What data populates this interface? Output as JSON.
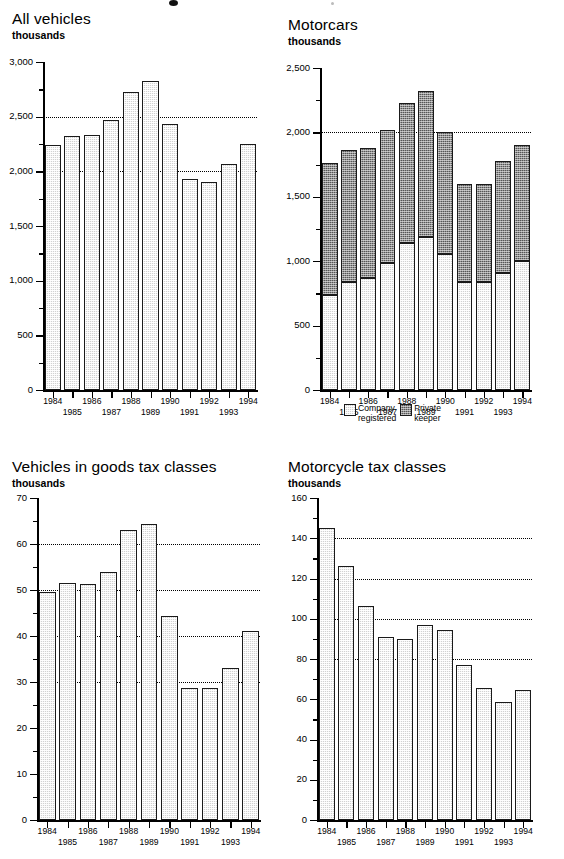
{
  "charts": [
    {
      "id": "all-vehicles",
      "title": "All vehicles",
      "units": "thousands",
      "chart_data": {
        "type": "bar",
        "title": "All vehicles",
        "xlabel": "",
        "ylabel": "thousands",
        "ylim": [
          0,
          3000
        ],
        "ytick_labels": [
          "0",
          "500",
          "1,000",
          "1,500",
          "2,000",
          "2,500",
          "3,000"
        ],
        "ytick_values": [
          0,
          500,
          1000,
          1500,
          2000,
          2500,
          3000
        ],
        "minor_tick_step": 250,
        "gridlines": [
          2000,
          2500
        ],
        "grid": "dotted-horizontal",
        "legend": "none",
        "categories": [
          "1984",
          "1985",
          "1986",
          "1987",
          "1988",
          "1989",
          "1990",
          "1991",
          "1992",
          "1993",
          "1994"
        ],
        "values": [
          2245,
          2320,
          2330,
          2470,
          2730,
          2830,
          2435,
          1930,
          1905,
          2070,
          2250
        ]
      }
    },
    {
      "id": "motorcars",
      "title": "Motorcars",
      "units": "thousands",
      "chart_data": {
        "type": "bar",
        "stacked": true,
        "title": "Motorcars",
        "xlabel": "",
        "ylabel": "thousands",
        "ylim": [
          0,
          2500
        ],
        "ytick_labels": [
          "0",
          "500",
          "1,000",
          "1,500",
          "2,000",
          "2,500"
        ],
        "ytick_values": [
          0,
          500,
          1000,
          1500,
          2000,
          2500
        ],
        "minor_tick_step": 250,
        "gridlines": [
          2000
        ],
        "grid": "dotted-horizontal",
        "legend": "bottom",
        "categories": [
          "1984",
          "1985",
          "1986",
          "1987",
          "1988",
          "1989",
          "1990",
          "1991",
          "1992",
          "1993",
          "1994"
        ],
        "series": [
          {
            "name": "Company registered",
            "values": [
              740,
              840,
              870,
              985,
              1140,
              1185,
              1055,
              840,
              840,
              905,
              1000
            ]
          },
          {
            "name": "Private keeper",
            "values": [
              1020,
              1020,
              1010,
              1030,
              1085,
              1135,
              950,
              760,
              760,
              870,
              905
            ]
          }
        ],
        "totals": [
          1760,
          1860,
          1880,
          2015,
          2225,
          2320,
          2005,
          1600,
          1600,
          1775,
          1905
        ],
        "legend_entries": [
          {
            "label": "Company\nregistered",
            "swatch": "light"
          },
          {
            "label": "Private\nkeeper",
            "swatch": "dark"
          }
        ]
      }
    },
    {
      "id": "goods-tax-classes",
      "title": "Vehicles in goods tax classes",
      "units": "thousands",
      "chart_data": {
        "type": "bar",
        "title": "Vehicles in goods tax classes",
        "xlabel": "",
        "ylabel": "thousands",
        "ylim": [
          0,
          70
        ],
        "ytick_labels": [
          "0",
          "10",
          "20",
          "30",
          "40",
          "50",
          "60",
          "70"
        ],
        "ytick_values": [
          0,
          10,
          20,
          30,
          40,
          50,
          60,
          70
        ],
        "minor_tick_step": 5,
        "gridlines": [
          30,
          40,
          50,
          60
        ],
        "grid": "dotted-horizontal",
        "legend": "none",
        "categories": [
          "1984",
          "1985",
          "1986",
          "1987",
          "1988",
          "1989",
          "1990",
          "1991",
          "1992",
          "1993",
          "1994"
        ],
        "values": [
          49.5,
          51.5,
          51.2,
          54.0,
          63.0,
          64.3,
          44.3,
          28.7,
          28.7,
          33.0,
          41.0
        ]
      }
    },
    {
      "id": "motorcycle-tax-classes",
      "title": "Motorcycle tax classes",
      "units": "thousands",
      "chart_data": {
        "type": "bar",
        "title": "Motorcycle tax classes",
        "xlabel": "",
        "ylabel": "thousands",
        "ylim": [
          0,
          160
        ],
        "ytick_labels": [
          "0",
          "20",
          "40",
          "60",
          "80",
          "100",
          "120",
          "140",
          "160"
        ],
        "ytick_values": [
          0,
          20,
          40,
          60,
          80,
          100,
          120,
          140,
          160
        ],
        "minor_tick_step": 10,
        "gridlines": [
          80,
          100,
          120,
          140
        ],
        "grid": "dotted-horizontal",
        "legend": "none",
        "categories": [
          "1984",
          "1985",
          "1986",
          "1987",
          "1988",
          "1989",
          "1990",
          "1991",
          "1992",
          "1993",
          "1994"
        ],
        "values": [
          145,
          126,
          106.5,
          91,
          90,
          97,
          94.5,
          77,
          65.5,
          58.5,
          64.5
        ]
      }
    }
  ]
}
